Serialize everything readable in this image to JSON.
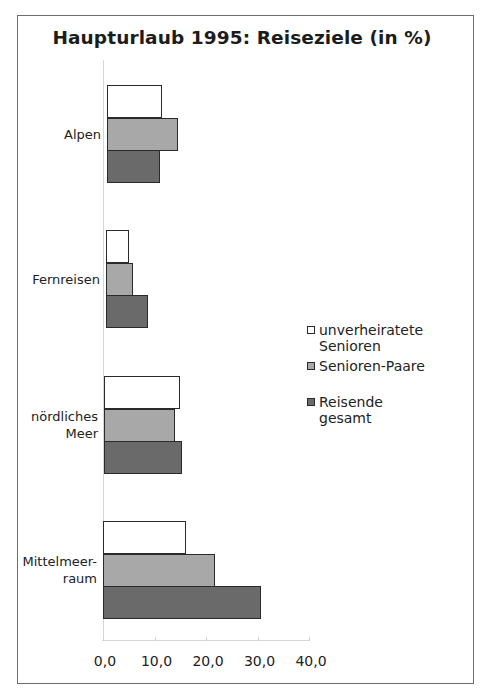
{
  "chart_data": {
    "type": "bar",
    "orientation": "horizontal",
    "title": "Haupturlaub 1995: Reiseziele (in %)",
    "xlabel": "",
    "ylabel": "",
    "xlim": [
      0,
      40
    ],
    "grid": false,
    "legend_position": "right",
    "categories": [
      "Alpen",
      "Fernreisen",
      "nördliches Meer",
      "Mittelmeerraum"
    ],
    "category_labels_display": [
      "Alpen",
      "Fernreisen",
      "nördliches\nMeer",
      "Mittelmeer-\nraum"
    ],
    "x_ticks": [
      "0,0",
      "10,0",
      "20,0",
      "30,0",
      "40,0"
    ],
    "series": [
      {
        "name": "unverheiratete Senioren",
        "color": "#ffffff",
        "values": [
          10.5,
          4.3,
          14.5,
          16.0
        ]
      },
      {
        "name": "Senioren-Paare",
        "color": "#a8a8a8",
        "values": [
          13.5,
          5.0,
          13.5,
          21.5
        ]
      },
      {
        "name": "Reisende gesamt",
        "color": "#6a6a6a",
        "values": [
          10.0,
          8.0,
          15.0,
          30.5
        ]
      }
    ]
  },
  "legend": {
    "items": [
      {
        "label": "unverheiratete\nSenioren"
      },
      {
        "label": "Senioren-Paare"
      },
      {
        "label": "Reisende  gesamt"
      }
    ]
  }
}
